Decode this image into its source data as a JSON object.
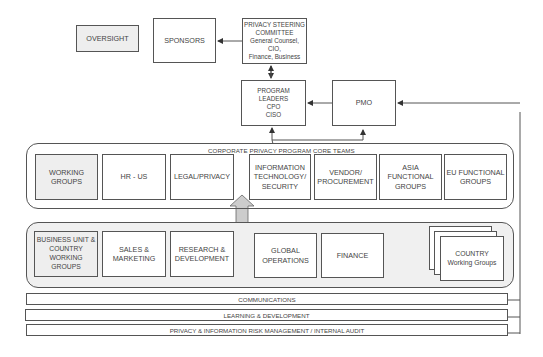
{
  "top": {
    "oversight": "OVERSIGHT",
    "sponsors": "SPONSORS",
    "steering_committee": {
      "title": "PRIVACY STEERING\nCOMMITTEE",
      "members": "General Counsel, CIO,\nFinance, Business"
    },
    "program_leaders": "PROGRAM LEADERS\nCPO\nCISO",
    "pmo": "PMO"
  },
  "core_teams": {
    "title": "CORPORATE PRIVACY PROGRAM CORE TEAMS",
    "items": [
      {
        "label": "WORKING\nGROUPS",
        "highlight": true
      },
      {
        "label": "HR - US"
      },
      {
        "label": "LEGAL/PRIVACY"
      },
      {
        "label": "INFORMATION\nTECHNOLOGY/\nSECURITY"
      },
      {
        "label": "VENDOR/\nPROCUREMENT"
      },
      {
        "label": "ASIA\nFUNCTIONAL\nGROUPS"
      },
      {
        "label": "EU FUNCTIONAL\nGROUPS"
      }
    ]
  },
  "business_units": {
    "items": [
      {
        "label": "BUSINESS UNIT &\nCOUNTRY\nWORKING\nGROUPS",
        "highlight": true
      },
      {
        "label": "SALES &\nMARKETING"
      },
      {
        "label": "RESEARCH &\nDEVELOPMENT"
      },
      {
        "label": "GLOBAL\nOPERATIONS"
      },
      {
        "label": "FINANCE"
      }
    ],
    "country": "COUNTRY\nWorking Groups"
  },
  "bars": [
    "COMMUNICATIONS",
    "LEARNING & DEVELOPMENT",
    "PRIVACY & INFORMATION RISK MANAGEMENT / INTERNAL AUDIT"
  ],
  "colors": {
    "line": "#555555",
    "highlight_fill": "#eeeeee",
    "panel_fill": "#f0f0f0",
    "arrow_fill": "#cccccc"
  }
}
